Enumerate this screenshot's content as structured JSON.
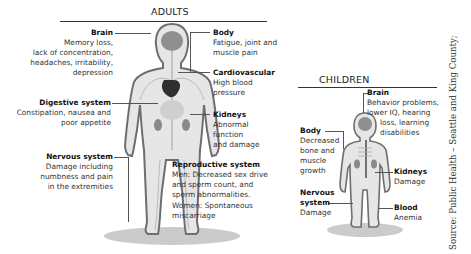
{
  "adults": {
    "title": "ADULTS",
    "labels": {
      "brain": {
        "title": "Brain",
        "lines": [
          "Memory loss,",
          "lack of concentration,",
          "headaches, irritability,",
          "depression"
        ]
      },
      "digestive": {
        "title": "Digestive system",
        "lines": [
          "Constipation, nausea and",
          "poor appetite"
        ]
      },
      "nervous": {
        "title": "Nervous system",
        "lines": [
          "Damage including",
          "numbness and pain",
          "in the extremities"
        ]
      },
      "body": {
        "title": "Body",
        "lines": [
          "Fatigue, joint and",
          "muscle pain"
        ]
      },
      "cardiovascular": {
        "title": "Cardiovascular",
        "lines": [
          "High blood",
          "pressure"
        ]
      },
      "kidneys": {
        "title": "Kidneys",
        "lines": [
          "Abnormal",
          "function",
          "and damage"
        ]
      },
      "reproductive": {
        "title": "Reproductive system",
        "lines": [
          "Men: Decreased sex drive",
          "and sperm count, and",
          "sperm abnormalities.",
          "Women: Spontaneous",
          "miscarriage"
        ]
      }
    }
  },
  "children": {
    "title": "CHILDREN",
    "labels": {
      "brain": {
        "title": "Brain",
        "lines": [
          "Behavior problems,",
          "lower IQ, hearing",
          "loss, learning",
          "disabilities"
        ]
      },
      "body": {
        "title": "Body",
        "lines": [
          "Decreased",
          "bone and",
          "muscle",
          "growth"
        ]
      },
      "nervous": {
        "title_line1": "Nervous",
        "title_line2": "system",
        "lines": [
          "Damage"
        ]
      },
      "kidneys": {
        "title": "Kidneys",
        "lines": [
          "Damage"
        ]
      },
      "blood": {
        "title": "Blood",
        "lines": [
          "Anemia"
        ]
      }
    }
  },
  "source": "Source: Public Health – Seattle and King County;",
  "colors": {
    "figure_fill": "#e6e6e6",
    "figure_outline": "#6e6e6e",
    "organ": "#8a8a8a",
    "heart": "#3a3a3a",
    "shadow": "#9a9a9a"
  }
}
